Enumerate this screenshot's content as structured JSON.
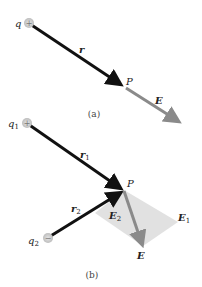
{
  "colors": {
    "background": "#ffffff",
    "position_vector": "#111111",
    "field_vector": "#8a8a8a",
    "parallelogram": "#d8d8d8",
    "charge_fill": "#c8c8c8",
    "text": "#222222"
  },
  "panel_a": {
    "caption": "(a)",
    "charge": {
      "label": "q",
      "sign": "+"
    },
    "vector_r": {
      "label": "r"
    },
    "point": {
      "label": "P"
    },
    "vector_E": {
      "label": "E"
    }
  },
  "panel_b": {
    "caption": "(b)",
    "charge1": {
      "label": "q",
      "subscript": "1",
      "sign": "+"
    },
    "charge2": {
      "label": "q",
      "subscript": "2",
      "sign": "−"
    },
    "vector_r1": {
      "label": "r",
      "subscript": "1"
    },
    "vector_r2": {
      "label": "r",
      "subscript": "2"
    },
    "point": {
      "label": "P"
    },
    "vector_E1": {
      "label": "E",
      "subscript": "1"
    },
    "vector_E2": {
      "label": "E",
      "subscript": "2"
    },
    "vector_E": {
      "label": "E"
    }
  }
}
